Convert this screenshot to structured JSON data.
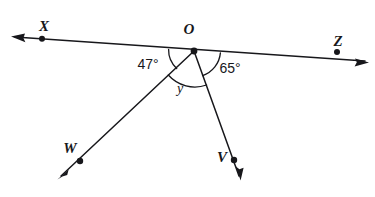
{
  "figure": {
    "type": "geometry-angle-diagram",
    "background_color": "#ffffff",
    "ink_color": "#17171b",
    "vertex": {
      "label": "O",
      "x": 194,
      "y": 51,
      "label_x": 195,
      "label_y": 34
    },
    "points": [
      {
        "name": "X",
        "label": "X",
        "x": 42,
        "y": 39,
        "label_x": 44,
        "label_y": 31,
        "arrow_tip_x": 13,
        "arrow_tip_y": 37
      },
      {
        "name": "Z",
        "label": "Z",
        "x": 337,
        "y": 52,
        "label_x": 337,
        "label_y": 46,
        "arrow_tip_x": 367,
        "arrow_tip_y": 62
      },
      {
        "name": "W",
        "label": "W",
        "x": 80,
        "y": 161,
        "label_x": 70,
        "label_y": 153,
        "arrow_tip_x": 58,
        "arrow_tip_y": 178
      },
      {
        "name": "V",
        "label": "V",
        "x": 234,
        "y": 160,
        "label_x": 222,
        "label_y": 161,
        "arrow_tip_x": 240,
        "arrow_tip_y": 179
      }
    ],
    "lines": [
      {
        "name": "line-XZ",
        "from": "X",
        "through": "O",
        "to": "Z",
        "double_arrow": true
      },
      {
        "name": "ray-OW",
        "from": "O",
        "to": "W",
        "double_arrow": false
      },
      {
        "name": "ray-OV",
        "from": "O",
        "to": "V",
        "double_arrow": false
      }
    ],
    "angles": [
      {
        "name": "angle-XOW",
        "label": "47°",
        "value": 47,
        "unit": "degrees",
        "label_x": 148,
        "label_y": 69,
        "between": [
          "X",
          "W"
        ]
      },
      {
        "name": "angle-WOV",
        "label": "y",
        "value": null,
        "unit": "unknown",
        "label_x": 180,
        "label_y": 93,
        "between": [
          "W",
          "V"
        ]
      },
      {
        "name": "angle-VOZ",
        "label": "65°",
        "value": 65,
        "unit": "degrees",
        "label_x": 229,
        "label_y": 73,
        "between": [
          "V",
          "Z"
        ]
      }
    ]
  }
}
